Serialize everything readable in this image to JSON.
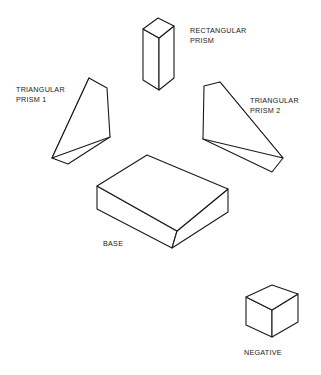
{
  "diagram": {
    "background_color": "#ffffff",
    "line_color": "#1a1a1a",
    "fill_color": "#ffffff",
    "parts": [
      {
        "id": "rectangular-prism",
        "label_line_1": "RECTANGULAR",
        "label_line_2": "PRISM",
        "label_x": 190,
        "label_y": 26,
        "shape": "rectangular prism, vertical, isometric"
      },
      {
        "id": "triangular-prism-1",
        "label_line_1": "TRIANGULAR",
        "label_line_2": "PRISM 1",
        "label_x": 16,
        "label_y": 85,
        "shape": "right triangular wedge, apex upper right"
      },
      {
        "id": "triangular-prism-2",
        "label_line_1": "TRIANGULAR",
        "label_line_2": "PRISM 2",
        "label_x": 250,
        "label_y": 96,
        "shape": "right triangular wedge, apex upper left"
      },
      {
        "id": "base",
        "label_line_1": "BASE",
        "label_line_2": "",
        "label_x": 103,
        "label_y": 239,
        "shape": "rectangular slab, isometric"
      },
      {
        "id": "negative",
        "label_line_1": "NEGATIVE",
        "label_line_2": "",
        "label_x": 244,
        "label_y": 348,
        "shape": "cube, isometric"
      }
    ]
  },
  "geometry": {
    "rect_prism_top": "143,29 158,18 174,26 159,38",
    "rect_prism_left": "143,29 159,38 159,90 143,80",
    "rect_prism_right": "159,38 174,26 174,78 159,90",
    "tri1_top": "89,78 107,88 110,137 52,158",
    "tri1_front": "89,78 52,158 68,164 110,137",
    "tri1_edge_a": "52,158 52,158",
    "tri2_top": "220,82 204,86 203,139 283,158",
    "tri2_front": "220,82 283,158 272,172 203,139",
    "base_top": "97,186 147,155 228,189 177,231",
    "base_left": "97,186 97,209 172,248 177,231",
    "base_right": "177,231 172,248 228,212 228,189",
    "neg_top": "246,297 272,285 298,294 272,310",
    "neg_left": "246,297 272,310 272,337 246,325",
    "neg_right": "272,310 298,294 298,322 272,337"
  }
}
